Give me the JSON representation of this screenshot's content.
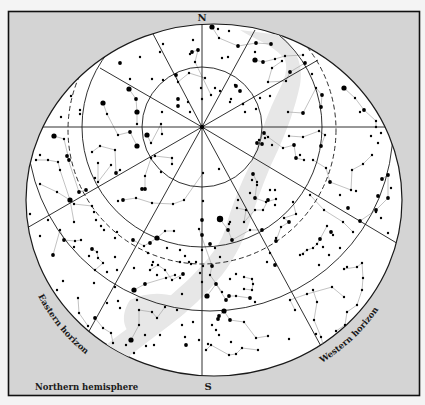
{
  "title": "Northern hemisphere",
  "compass": {
    "north": "N",
    "south": "S"
  },
  "horizons": {
    "east": "Eastern horizon",
    "west": "Western horizon"
  },
  "colors": {
    "frame_bg": "#d4d4d4",
    "sky": "#ffffff",
    "milky_way": "#e6e6e6",
    "lines": "#1a1a1a",
    "constellation_lines": "#a8a8a8",
    "stars": "#000000"
  },
  "geometry": {
    "zenith": [
      202,
      127
    ],
    "sky_ellipse": {
      "cx": 214,
      "cy": 200,
      "rx": 188,
      "ry": 176
    },
    "altitude_circles": [
      60,
      118
    ],
    "dashed_circle": {
      "cx": 202,
      "cy": 140,
      "r": 125
    },
    "horizon_ring": {
      "cx": 210,
      "cy": 128,
      "r": 182
    }
  },
  "stars": [
    [
      212,
      27,
      4
    ],
    [
      218,
      29,
      2
    ],
    [
      229,
      31,
      2
    ],
    [
      193,
      40,
      2
    ],
    [
      219,
      38,
      2
    ],
    [
      238,
      46,
      3
    ],
    [
      256,
      43,
      3
    ],
    [
      271,
      44,
      3
    ],
    [
      192,
      52,
      3
    ],
    [
      198,
      50,
      3
    ],
    [
      190,
      54,
      2
    ],
    [
      195,
      62,
      2
    ],
    [
      222,
      58,
      2
    ],
    [
      228,
      57,
      2
    ],
    [
      255,
      52,
      2
    ],
    [
      255,
      60,
      4
    ],
    [
      263,
      62,
      3
    ],
    [
      275,
      59,
      2
    ],
    [
      285,
      56,
      2
    ],
    [
      303,
      55,
      2
    ],
    [
      163,
      44,
      2
    ],
    [
      160,
      52,
      2
    ],
    [
      140,
      57,
      2
    ],
    [
      120,
      63,
      3
    ],
    [
      152,
      79,
      2
    ],
    [
      130,
      79,
      2
    ],
    [
      163,
      80,
      2
    ],
    [
      176,
      75,
      3
    ],
    [
      178,
      82,
      2
    ],
    [
      189,
      73,
      2
    ],
    [
      205,
      78,
      2
    ],
    [
      211,
      95,
      2
    ],
    [
      201,
      88,
      2
    ],
    [
      215,
      88,
      2
    ],
    [
      202,
      99,
      2
    ],
    [
      220,
      91,
      2
    ],
    [
      236,
      86,
      3
    ],
    [
      240,
      91,
      3
    ],
    [
      230,
      102,
      2
    ],
    [
      245,
      112,
      2
    ],
    [
      243,
      104,
      2
    ],
    [
      260,
      98,
      2
    ],
    [
      270,
      96,
      2
    ],
    [
      256,
      109,
      2
    ],
    [
      235,
      85,
      2
    ],
    [
      231,
      99,
      2
    ],
    [
      178,
      99,
      3
    ],
    [
      178,
      106,
      3
    ],
    [
      188,
      102,
      2
    ],
    [
      190,
      112,
      2
    ],
    [
      162,
      112,
      2
    ],
    [
      129,
      89,
      4
    ],
    [
      103,
      103,
      4
    ],
    [
      136,
      99,
      3
    ],
    [
      137,
      112,
      4
    ],
    [
      137,
      124,
      2
    ],
    [
      107,
      114,
      2
    ],
    [
      80,
      110,
      2
    ],
    [
      71,
      96,
      2
    ],
    [
      61,
      117,
      2
    ],
    [
      80,
      114,
      2
    ],
    [
      48,
      108,
      2
    ],
    [
      147,
      135,
      4
    ],
    [
      130,
      132,
      3
    ],
    [
      137,
      146,
      4
    ],
    [
      118,
      135,
      2
    ],
    [
      161,
      124,
      2
    ],
    [
      162,
      134,
      2
    ],
    [
      92,
      152,
      2
    ],
    [
      100,
      146,
      2
    ],
    [
      115,
      150,
      2
    ],
    [
      116,
      173,
      3
    ],
    [
      111,
      165,
      2
    ],
    [
      120,
      170,
      2
    ],
    [
      98,
      163,
      2
    ],
    [
      98,
      182,
      2
    ],
    [
      145,
      176,
      2
    ],
    [
      151,
      158,
      2
    ],
    [
      155,
      156,
      2
    ],
    [
      142,
      189,
      3
    ],
    [
      145,
      189,
      3
    ],
    [
      161,
      172,
      2
    ],
    [
      172,
      164,
      2
    ],
    [
      172,
      158,
      2
    ],
    [
      151,
      143,
      2
    ],
    [
      54,
      136,
      4
    ],
    [
      64,
      139,
      2
    ],
    [
      69,
      160,
      3
    ],
    [
      40,
      155,
      2
    ],
    [
      36,
      160,
      2
    ],
    [
      48,
      160,
      2
    ],
    [
      58,
      162,
      2
    ],
    [
      60,
      170,
      2
    ],
    [
      67,
      156,
      3
    ],
    [
      79,
      192,
      3
    ],
    [
      86,
      190,
      3
    ],
    [
      70,
      200,
      4
    ],
    [
      57,
      192,
      2
    ],
    [
      74,
      204,
      2
    ],
    [
      40,
      184,
      2
    ],
    [
      30,
      214,
      2
    ],
    [
      48,
      220,
      2
    ],
    [
      74,
      222,
      2
    ],
    [
      92,
      206,
      2
    ],
    [
      95,
      178,
      2
    ],
    [
      94,
      212,
      2
    ],
    [
      96,
      220,
      2
    ],
    [
      123,
      200,
      3
    ],
    [
      118,
      201,
      2
    ],
    [
      136,
      198,
      2
    ],
    [
      152,
      203,
      2
    ],
    [
      173,
      204,
      2
    ],
    [
      184,
      200,
      2
    ],
    [
      203,
      173,
      2
    ],
    [
      219,
      169,
      2
    ],
    [
      220,
      219,
      5
    ],
    [
      228,
      230,
      3
    ],
    [
      230,
      222,
      2
    ],
    [
      232,
      240,
      3
    ],
    [
      203,
      201,
      2
    ],
    [
      202,
      220,
      3
    ],
    [
      202,
      235,
      3
    ],
    [
      202,
      250,
      2
    ],
    [
      210,
      244,
      3
    ],
    [
      215,
      248,
      2
    ],
    [
      220,
      257,
      2
    ],
    [
      229,
      224,
      2
    ],
    [
      237,
      208,
      2
    ],
    [
      238,
      200,
      2
    ],
    [
      246,
      210,
      2
    ],
    [
      244,
      222,
      2
    ],
    [
      250,
      230,
      2
    ],
    [
      262,
      230,
      3
    ],
    [
      257,
      185,
      2
    ],
    [
      250,
      193,
      2
    ],
    [
      252,
      180,
      2
    ],
    [
      253,
      174,
      3
    ],
    [
      257,
      182,
      2
    ],
    [
      255,
      198,
      3
    ],
    [
      255,
      210,
      2
    ],
    [
      263,
      210,
      2
    ],
    [
      268,
      200,
      3
    ],
    [
      275,
      205,
      2
    ],
    [
      276,
      199,
      2
    ],
    [
      270,
      190,
      2
    ],
    [
      275,
      190,
      2
    ],
    [
      266,
      202,
      2
    ],
    [
      243,
      104,
      2
    ],
    [
      257,
      143,
      3
    ],
    [
      262,
      144,
      3
    ],
    [
      265,
      138,
      2
    ],
    [
      272,
      145,
      2
    ],
    [
      268,
      137,
      2
    ],
    [
      264,
      133,
      3
    ],
    [
      259,
      140,
      2
    ],
    [
      283,
      148,
      2
    ],
    [
      289,
      136,
      2
    ],
    [
      294,
      145,
      3
    ],
    [
      296,
      158,
      3
    ],
    [
      304,
      160,
      2
    ],
    [
      300,
      155,
      2
    ],
    [
      288,
      112,
      2
    ],
    [
      303,
      113,
      3
    ],
    [
      303,
      137,
      2
    ],
    [
      325,
      135,
      2
    ],
    [
      321,
      146,
      3
    ],
    [
      319,
      131,
      2
    ],
    [
      313,
      160,
      2
    ],
    [
      326,
      168,
      2
    ],
    [
      330,
      182,
      3
    ],
    [
      310,
      195,
      2
    ],
    [
      293,
      202,
      2
    ],
    [
      296,
      214,
      2
    ],
    [
      284,
      218,
      2
    ],
    [
      289,
      222,
      3
    ],
    [
      281,
      227,
      2
    ],
    [
      276,
      241,
      3
    ],
    [
      276,
      238,
      2
    ],
    [
      270,
      253,
      2
    ],
    [
      267,
      262,
      2
    ],
    [
      275,
      265,
      3
    ],
    [
      300,
      255,
      2
    ],
    [
      303,
      254,
      2
    ],
    [
      307,
      250,
      2
    ],
    [
      313,
      248,
      2
    ],
    [
      317,
      244,
      2
    ],
    [
      320,
      239,
      3
    ],
    [
      327,
      226,
      2
    ],
    [
      333,
      235,
      2
    ],
    [
      324,
      210,
      2
    ],
    [
      340,
      195,
      2
    ],
    [
      348,
      208,
      3
    ],
    [
      351,
      190,
      2
    ],
    [
      352,
      170,
      2
    ],
    [
      363,
      164,
      2
    ],
    [
      372,
      155,
      2
    ],
    [
      378,
      143,
      2
    ],
    [
      376,
      121,
      2
    ],
    [
      376,
      127,
      2
    ],
    [
      364,
      110,
      3
    ],
    [
      355,
      98,
      2
    ],
    [
      344,
      88,
      4
    ],
    [
      322,
      95,
      3
    ],
    [
      321,
      107,
      3
    ],
    [
      316,
      88,
      2
    ],
    [
      312,
      74,
      2
    ],
    [
      305,
      63,
      3
    ],
    [
      290,
      72,
      3
    ],
    [
      286,
      81,
      2
    ],
    [
      268,
      82,
      2
    ],
    [
      272,
      68,
      2
    ],
    [
      282,
      61,
      2
    ],
    [
      343,
      59,
      2
    ],
    [
      360,
      112,
      2
    ],
    [
      371,
      136,
      2
    ],
    [
      381,
      133,
      2
    ],
    [
      388,
      175,
      3
    ],
    [
      388,
      198,
      3
    ],
    [
      378,
      196,
      3
    ],
    [
      382,
      179,
      3
    ],
    [
      391,
      188,
      2
    ],
    [
      388,
      233,
      2
    ],
    [
      381,
      218,
      2
    ],
    [
      360,
      221,
      3
    ],
    [
      376,
      210,
      3
    ],
    [
      376,
      212,
      2
    ],
    [
      356,
      191,
      2
    ],
    [
      353,
      232,
      2
    ],
    [
      343,
      222,
      2
    ],
    [
      331,
      232,
      3
    ],
    [
      323,
      247,
      2
    ],
    [
      340,
      248,
      2
    ],
    [
      329,
      255,
      2
    ],
    [
      319,
      265,
      2
    ],
    [
      313,
      290,
      2
    ],
    [
      317,
      302,
      2
    ],
    [
      314,
      320,
      2
    ],
    [
      321,
      337,
      2
    ],
    [
      326,
      356,
      2
    ],
    [
      344,
      269,
      2
    ],
    [
      347,
      267,
      2
    ],
    [
      357,
      267,
      2
    ],
    [
      363,
      278,
      2
    ],
    [
      362,
      263,
      2
    ],
    [
      362,
      290,
      2
    ],
    [
      357,
      305,
      2
    ],
    [
      347,
      312,
      2
    ],
    [
      345,
      325,
      2
    ],
    [
      336,
      331,
      2
    ],
    [
      349,
      340,
      2
    ],
    [
      344,
      297,
      2
    ],
    [
      332,
      287,
      2
    ],
    [
      307,
      294,
      2
    ],
    [
      290,
      300,
      2
    ],
    [
      295,
      310,
      2
    ],
    [
      316,
      334,
      2
    ],
    [
      289,
      339,
      2
    ],
    [
      268,
      336,
      2
    ],
    [
      256,
      338,
      2
    ],
    [
      244,
      322,
      2
    ],
    [
      230,
      320,
      3
    ],
    [
      219,
      316,
      3
    ],
    [
      226,
      300,
      3
    ],
    [
      224,
      311,
      4
    ],
    [
      218,
      319,
      3
    ],
    [
      207,
      296,
      4
    ],
    [
      229,
      296,
      3
    ],
    [
      236,
      296,
      2
    ],
    [
      250,
      298,
      3
    ],
    [
      255,
      302,
      2
    ],
    [
      252,
      279,
      2
    ],
    [
      253,
      284,
      2
    ],
    [
      252,
      290,
      2
    ],
    [
      244,
      277,
      2
    ],
    [
      236,
      274,
      2
    ],
    [
      244,
      289,
      2
    ],
    [
      222,
      292,
      2
    ],
    [
      216,
      284,
      3
    ],
    [
      212,
      266,
      3
    ],
    [
      230,
      279,
      2
    ],
    [
      191,
      264,
      2
    ],
    [
      200,
      273,
      2
    ],
    [
      202,
      282,
      2
    ],
    [
      203,
      266,
      2
    ],
    [
      210,
      275,
      2
    ],
    [
      219,
      335,
      2
    ],
    [
      206,
      350,
      2
    ],
    [
      211,
      345,
      2
    ],
    [
      229,
      355,
      2
    ],
    [
      236,
      354,
      2
    ],
    [
      242,
      348,
      2
    ],
    [
      258,
      350,
      2
    ],
    [
      231,
      342,
      2
    ],
    [
      208,
      344,
      2
    ],
    [
      216,
      330,
      2
    ],
    [
      212,
      325,
      2
    ],
    [
      183,
      274,
      3
    ],
    [
      180,
      278,
      2
    ],
    [
      172,
      280,
      2
    ],
    [
      165,
      270,
      2
    ],
    [
      158,
      265,
      2
    ],
    [
      150,
      270,
      2
    ],
    [
      153,
      262,
      2
    ],
    [
      166,
      278,
      2
    ],
    [
      182,
      294,
      2
    ],
    [
      177,
      310,
      2
    ],
    [
      182,
      325,
      2
    ],
    [
      160,
      335,
      2
    ],
    [
      154,
      345,
      2
    ],
    [
      145,
      335,
      2
    ],
    [
      146,
      346,
      2
    ],
    [
      131,
      340,
      4
    ],
    [
      126,
      345,
      2
    ],
    [
      134,
      353,
      2
    ],
    [
      139,
      325,
      2
    ],
    [
      139,
      310,
      2
    ],
    [
      152,
      312,
      2
    ],
    [
      157,
      318,
      2
    ],
    [
      165,
      307,
      2
    ],
    [
      186,
      345,
      3
    ],
    [
      193,
      322,
      2
    ],
    [
      199,
      340,
      2
    ],
    [
      185,
      337,
      2
    ],
    [
      134,
      290,
      4
    ],
    [
      145,
      284,
      3
    ],
    [
      115,
      287,
      2
    ],
    [
      118,
      301,
      2
    ],
    [
      107,
      303,
      2
    ],
    [
      133,
      240,
      3
    ],
    [
      157,
      238,
      4
    ],
    [
      150,
      243,
      3
    ],
    [
      144,
      246,
      2
    ],
    [
      174,
      231,
      2
    ],
    [
      167,
      248,
      2
    ],
    [
      180,
      250,
      2
    ],
    [
      180,
      262,
      2
    ],
    [
      189,
      262,
      2
    ],
    [
      185,
      256,
      2
    ],
    [
      196,
      262,
      2
    ],
    [
      148,
      253,
      2
    ],
    [
      152,
      265,
      2
    ],
    [
      134,
      268,
      2
    ],
    [
      157,
      275,
      2
    ],
    [
      175,
      275,
      2
    ],
    [
      115,
      257,
      2
    ],
    [
      117,
      270,
      2
    ],
    [
      95,
      270,
      2
    ],
    [
      103,
      263,
      2
    ],
    [
      89,
      256,
      2
    ],
    [
      92,
      249,
      3
    ],
    [
      97,
      252,
      2
    ],
    [
      98,
      258,
      2
    ],
    [
      74,
      247,
      2
    ],
    [
      53,
      255,
      3
    ],
    [
      40,
      236,
      2
    ],
    [
      60,
      230,
      2
    ],
    [
      64,
      240,
      3
    ],
    [
      81,
      240,
      2
    ],
    [
      117,
      232,
      2
    ],
    [
      115,
      238,
      2
    ],
    [
      104,
      230,
      2
    ],
    [
      101,
      226,
      2
    ],
    [
      94,
      283,
      2
    ],
    [
      75,
      241,
      2
    ],
    [
      107,
      272,
      2
    ],
    [
      120,
      308,
      2
    ],
    [
      95,
      318,
      3
    ],
    [
      103,
      328,
      2
    ],
    [
      111,
      333,
      2
    ],
    [
      113,
      343,
      2
    ],
    [
      88,
      326,
      2
    ],
    [
      78,
      298,
      2
    ],
    [
      79,
      313,
      2
    ],
    [
      63,
      281,
      2
    ],
    [
      57,
      290,
      2
    ],
    [
      41,
      332,
      2
    ],
    [
      137,
      300,
      2
    ],
    [
      165,
      231,
      2
    ],
    [
      199,
      229,
      2
    ]
  ],
  "milky_way_label": ""
}
